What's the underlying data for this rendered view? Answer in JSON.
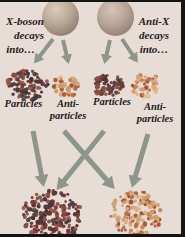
{
  "diagram": {
    "left_caption": {
      "line1": "X-boson",
      "line2": "decays",
      "line3": "into…"
    },
    "right_caption": {
      "line1": "Anti-X",
      "line2": "decays",
      "line3": "into…"
    },
    "mid_labels": [
      {
        "text": "Particles"
      },
      {
        "line1": "Anti-",
        "line2": "particles"
      },
      {
        "text": "Particles"
      },
      {
        "line1": "Anti-",
        "line2": "particles"
      }
    ]
  },
  "colors": {
    "background": "#e8ddd6",
    "frame": "#141414",
    "text": "#27201d",
    "arrow": "#8e968c",
    "sphere_light": "#dacbbc",
    "sphere_dark": "#786a5c",
    "particle_palette": [
      "#7a3533",
      "#652b2c",
      "#55403f",
      "#8c4a40",
      "#3f3337",
      "#74524a",
      "#92574b",
      "#4a3b42",
      "#6e3a36"
    ],
    "antiparticle_palette": [
      "#d09a6a",
      "#c68255",
      "#dcae82",
      "#b96a42",
      "#a85a3e",
      "#e2bd92",
      "#9c4f38",
      "#caa27e",
      "#d8a874"
    ]
  }
}
